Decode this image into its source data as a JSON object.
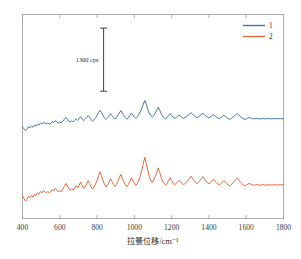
{
  "chart_data": {
    "type": "line",
    "title": "",
    "subtitle": "",
    "xlabel": "拉曼位移/cm⁻¹",
    "ylabel": "",
    "xlim": [
      400,
      1800
    ],
    "ylim": [
      0,
      4200
    ],
    "grid": false,
    "x_ticks": [
      400,
      600,
      800,
      1000,
      1200,
      1400,
      1600,
      1800
    ],
    "x_tick_labels": [
      "400",
      "600",
      "800",
      "1000",
      "1200",
      "1400",
      "1600",
      "1800"
    ],
    "y_ticks": [],
    "y_tick_labels": [],
    "legend_position": "top-right",
    "legend": [
      {
        "name": "1",
        "color": "#4574a8"
      },
      {
        "name": "2",
        "color": "#e8663c"
      }
    ],
    "annotations": [
      {
        "name": "intensity-scale-bar",
        "label": "1300 cps",
        "value": 1300,
        "units": "cps",
        "x": 835,
        "y_bottom": 2620,
        "y_top": 3920
      }
    ],
    "series": [
      {
        "name": "1",
        "color": "#4574a8",
        "offset": 1750,
        "x": [
          400,
          408,
          416,
          424,
          432,
          440,
          448,
          456,
          464,
          472,
          480,
          488,
          496,
          504,
          512,
          520,
          528,
          536,
          544,
          552,
          560,
          568,
          576,
          584,
          592,
          600,
          608,
          616,
          624,
          632,
          640,
          648,
          656,
          664,
          672,
          680,
          688,
          696,
          704,
          712,
          720,
          728,
          736,
          744,
          752,
          760,
          768,
          776,
          784,
          792,
          800,
          808,
          816,
          824,
          832,
          840,
          848,
          856,
          864,
          872,
          880,
          888,
          896,
          904,
          912,
          920,
          928,
          936,
          944,
          952,
          960,
          968,
          976,
          984,
          992,
          1000,
          1008,
          1016,
          1024,
          1032,
          1040,
          1048,
          1056,
          1064,
          1072,
          1080,
          1088,
          1096,
          1104,
          1112,
          1120,
          1128,
          1136,
          1144,
          1152,
          1160,
          1168,
          1176,
          1184,
          1192,
          1200,
          1208,
          1216,
          1224,
          1232,
          1240,
          1248,
          1256,
          1264,
          1272,
          1280,
          1288,
          1296,
          1304,
          1312,
          1320,
          1328,
          1336,
          1344,
          1352,
          1360,
          1368,
          1376,
          1384,
          1392,
          1400,
          1408,
          1416,
          1424,
          1432,
          1440,
          1448,
          1456,
          1464,
          1472,
          1480,
          1488,
          1496,
          1504,
          1512,
          1520,
          1528,
          1536,
          1544,
          1552,
          1560,
          1568,
          1576,
          1584,
          1592,
          1600,
          1608,
          1616,
          1624,
          1632,
          1640,
          1648,
          1656,
          1664,
          1672,
          1680,
          1688,
          1696,
          1704,
          1712,
          1720,
          1728,
          1736,
          1744,
          1752,
          1760,
          1768,
          1776,
          1784,
          1792,
          1800
        ],
        "values": [
          135,
          95,
          60,
          90,
          140,
          120,
          150,
          130,
          175,
          150,
          190,
          175,
          215,
          195,
          230,
          215,
          200,
          215,
          195,
          215,
          245,
          225,
          265,
          240,
          210,
          235,
          215,
          255,
          290,
          330,
          300,
          255,
          235,
          260,
          240,
          270,
          300,
          270,
          305,
          345,
          300,
          265,
          295,
          330,
          370,
          330,
          285,
          255,
          285,
          325,
          375,
          430,
          480,
          430,
          370,
          320,
          290,
          320,
          365,
          410,
          370,
          330,
          300,
          330,
          380,
          430,
          470,
          420,
          365,
          325,
          295,
          325,
          370,
          420,
          380,
          340,
          310,
          340,
          390,
          450,
          520,
          600,
          680,
          600,
          500,
          420,
          370,
          340,
          370,
          420,
          480,
          540,
          480,
          410,
          355,
          320,
          300,
          330,
          370,
          410,
          370,
          335,
          310,
          330,
          355,
          380,
          355,
          330,
          310,
          330,
          350,
          370,
          400,
          430,
          400,
          370,
          345,
          325,
          345,
          370,
          395,
          420,
          390,
          360,
          335,
          320,
          340,
          365,
          390,
          365,
          340,
          320,
          305,
          325,
          350,
          375,
          350,
          325,
          305,
          290,
          310,
          335,
          360,
          385,
          410,
          380,
          350,
          325,
          305,
          290,
          300,
          315,
          330,
          320,
          310,
          300,
          305,
          310,
          305,
          300,
          305,
          310,
          305,
          300,
          305,
          308,
          305,
          302,
          305,
          308,
          305,
          302,
          305,
          308,
          305,
          302
        ]
      },
      {
        "name": "2",
        "color": "#e8663c",
        "offset": 300,
        "x": [
          400,
          408,
          416,
          424,
          432,
          440,
          448,
          456,
          464,
          472,
          480,
          488,
          496,
          504,
          512,
          520,
          528,
          536,
          544,
          552,
          560,
          568,
          576,
          584,
          592,
          600,
          608,
          616,
          624,
          632,
          640,
          648,
          656,
          664,
          672,
          680,
          688,
          696,
          704,
          712,
          720,
          728,
          736,
          744,
          752,
          760,
          768,
          776,
          784,
          792,
          800,
          808,
          816,
          824,
          832,
          840,
          848,
          856,
          864,
          872,
          880,
          888,
          896,
          904,
          912,
          920,
          928,
          936,
          944,
          952,
          960,
          968,
          976,
          984,
          992,
          1000,
          1008,
          1016,
          1024,
          1032,
          1040,
          1048,
          1056,
          1064,
          1072,
          1080,
          1088,
          1096,
          1104,
          1112,
          1120,
          1128,
          1136,
          1144,
          1152,
          1160,
          1168,
          1176,
          1184,
          1192,
          1200,
          1208,
          1216,
          1224,
          1232,
          1240,
          1248,
          1256,
          1264,
          1272,
          1280,
          1288,
          1296,
          1304,
          1312,
          1320,
          1328,
          1336,
          1344,
          1352,
          1360,
          1368,
          1376,
          1384,
          1392,
          1400,
          1408,
          1416,
          1424,
          1432,
          1440,
          1448,
          1456,
          1464,
          1472,
          1480,
          1488,
          1496,
          1504,
          1512,
          1520,
          1528,
          1536,
          1544,
          1552,
          1560,
          1568,
          1576,
          1584,
          1592,
          1600,
          1608,
          1616,
          1624,
          1632,
          1640,
          1648,
          1656,
          1664,
          1672,
          1680,
          1688,
          1696,
          1704,
          1712,
          1720,
          1728,
          1736,
          1744,
          1752,
          1760,
          1768,
          1776,
          1784,
          1792,
          1800
        ],
        "values": [
          170,
          110,
          55,
          95,
          160,
          130,
          175,
          145,
          200,
          170,
          225,
          200,
          255,
          230,
          280,
          250,
          230,
          255,
          225,
          255,
          300,
          265,
          320,
          285,
          245,
          280,
          250,
          300,
          360,
          420,
          375,
          310,
          280,
          315,
          285,
          330,
          375,
          330,
          385,
          450,
          380,
          320,
          360,
          410,
          480,
          420,
          350,
          305,
          350,
          410,
          490,
          580,
          660,
          580,
          480,
          400,
          350,
          390,
          450,
          520,
          460,
          400,
          360,
          400,
          470,
          550,
          610,
          530,
          450,
          395,
          355,
          400,
          460,
          540,
          480,
          420,
          380,
          420,
          490,
          580,
          700,
          830,
          960,
          830,
          690,
          570,
          490,
          440,
          490,
          560,
          650,
          740,
          650,
          545,
          465,
          415,
          385,
          425,
          480,
          540,
          480,
          430,
          395,
          420,
          455,
          490,
          455,
          420,
          395,
          420,
          450,
          480,
          525,
          570,
          525,
          480,
          445,
          415,
          445,
          480,
          520,
          560,
          515,
          470,
          435,
          415,
          440,
          475,
          510,
          475,
          440,
          410,
          390,
          415,
          450,
          485,
          450,
          415,
          390,
          370,
          395,
          430,
          465,
          500,
          535,
          495,
          455,
          420,
          390,
          370,
          385,
          405,
          425,
          410,
          395,
          385,
          390,
          398,
          392,
          385,
          392,
          398,
          392,
          385,
          392,
          396,
          392,
          388,
          392,
          396,
          392,
          388,
          392,
          396,
          392,
          388
        ]
      }
    ]
  },
  "axis": {
    "frame_color": "#9a9a9a",
    "tick_color": "#9a9a9a"
  },
  "background": "#ffffff"
}
